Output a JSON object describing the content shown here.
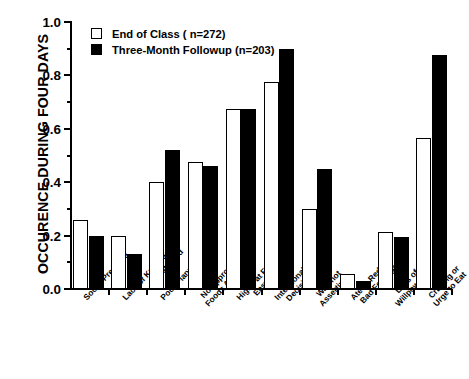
{
  "chart_data": {
    "type": "bar",
    "title": "",
    "xlabel": "",
    "ylabel": "OCCURENCE DURING FOUR DAYS",
    "ylim": [
      0.0,
      1.0
    ],
    "ytick_labels": [
      "0.0",
      "0.2",
      "0.4",
      "0.6",
      "0.8",
      "1.0"
    ],
    "ytick_values": [
      0.0,
      0.2,
      0.4,
      0.6,
      0.8,
      1.0
    ],
    "yminor_values": [
      0.1,
      0.3,
      0.5,
      0.7,
      0.9
    ],
    "grid": false,
    "legend_position": "top-left",
    "categories": [
      "Social Pressure",
      "Lack of Knowledge about Food",
      "Poor Planning",
      "No Appropriate Foods Available",
      "High Fat Foods Easy to Get",
      "Intentional Decision",
      "Was not Assertive",
      "Ate to Reduce Bad Feelings",
      "Loss of Willpower",
      "Craving or Urge to Eat"
    ],
    "category_lines": [
      [
        "Social Pressure"
      ],
      [
        "Lack of Knowledge",
        "about Food"
      ],
      [
        "Poor Planning"
      ],
      [
        "No Appropriate",
        "Foods Available"
      ],
      [
        "High Fat Foods",
        "Easy to Get"
      ],
      [
        "Intentional",
        "Decision"
      ],
      [
        "Was not",
        "Assertive"
      ],
      [
        "Ate to Reduce",
        "Bad Feelings"
      ],
      [
        "Loss of",
        "Willpower"
      ],
      [
        "Craving or",
        "Urge to Eat"
      ]
    ],
    "series": [
      {
        "name": "End of Class ( n=272)",
        "style": "open",
        "color": "#ffffff",
        "edge_color": "#000000",
        "values": [
          0.26,
          0.2,
          0.4,
          0.475,
          0.675,
          0.775,
          0.3,
          0.055,
          0.215,
          0.565
        ]
      },
      {
        "name": "Three-Month Followup (n=203)",
        "style": "filled",
        "color": "#000000",
        "edge_color": "#000000",
        "values": [
          0.2,
          0.13,
          0.52,
          0.46,
          0.675,
          0.9,
          0.45,
          0.03,
          0.195,
          0.875
        ]
      }
    ]
  },
  "legend": {
    "items": [
      {
        "label": "End of Class ( n=272)",
        "style": "open"
      },
      {
        "label": "Three-Month Followup (n=203)",
        "style": "filled"
      }
    ]
  }
}
